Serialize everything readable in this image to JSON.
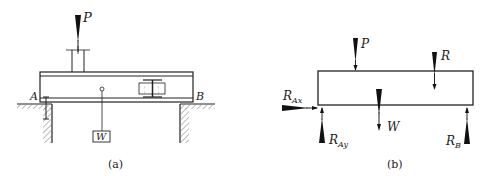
{
  "figure_a": {
    "caption": "(a)",
    "labels": {
      "load": "P",
      "support_left": "A",
      "support_right": "B",
      "weight": "W"
    }
  },
  "figure_b": {
    "caption": "(b)",
    "labels": {
      "load": "P",
      "trolley_reaction": "R",
      "weight": "W",
      "reaction_ax_main": "R",
      "reaction_ax_sub": "Ax",
      "reaction_ay_main": "R",
      "reaction_ay_sub": "Ay",
      "reaction_b_main": "R",
      "reaction_b_sub": "B"
    }
  }
}
